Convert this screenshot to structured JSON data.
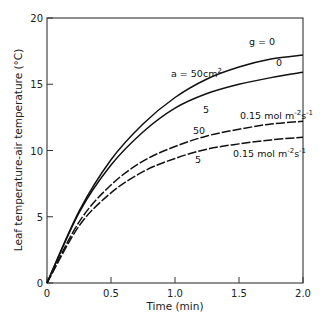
{
  "chart_data": {
    "type": "line",
    "title": "",
    "xlabel": "Time (min)",
    "ylabel": "Leaf temperature-air temperature (°C)",
    "xlim": [
      0,
      2.0
    ],
    "ylim": [
      0,
      20
    ],
    "xticks": [
      "0",
      "0.5",
      "1.0",
      "1.5",
      "2.0"
    ],
    "yticks": [
      "0",
      "5",
      "10",
      "15",
      "20"
    ],
    "grid": false,
    "legend": "none (inline curve annotations)",
    "x": [
      0,
      0.25,
      0.5,
      0.75,
      1.0,
      1.25,
      1.5,
      1.75,
      2.0
    ],
    "series": [
      {
        "name": "a = 50 cm², g = 0",
        "style": "solid",
        "values": [
          0,
          5.4,
          9.3,
          12.0,
          14.0,
          15.4,
          16.3,
          16.9,
          17.2
        ]
      },
      {
        "name": "a = 5 cm², g = 0",
        "style": "solid",
        "values": [
          0,
          5.3,
          8.9,
          11.4,
          13.2,
          14.3,
          15.0,
          15.5,
          15.9
        ]
      },
      {
        "name": "a = 50 cm², g = 0.15 mol m⁻² s⁻¹",
        "style": "dashed",
        "values": [
          0,
          4.6,
          7.4,
          9.2,
          10.3,
          11.1,
          11.6,
          12.0,
          12.2
        ]
      },
      {
        "name": "a = 5 cm², g = 0.15 mol m⁻² s⁻¹",
        "style": "dashed",
        "values": [
          0,
          4.3,
          6.8,
          8.4,
          9.4,
          10.1,
          10.5,
          10.8,
          11.0
        ]
      }
    ],
    "annotations": [
      {
        "text": "g = 0",
        "x": 1.73,
        "y": 18.0
      },
      {
        "text": "0",
        "x": 1.78,
        "y": 16.4
      },
      {
        "text": "a = 50cm²",
        "x": 0.78,
        "y": 15.6
      },
      {
        "text": "5",
        "x": 0.92,
        "y": 12.9
      },
      {
        "text": "0.15 mol m⁻²s⁻¹",
        "x": 1.42,
        "y": 12.6
      },
      {
        "text": "50",
        "x": 0.88,
        "y": 11.0
      },
      {
        "text": "5",
        "x": 0.88,
        "y": 9.1
      },
      {
        "text": "0.15 mol m⁻²s⁻¹",
        "x": 1.33,
        "y": 9.5
      }
    ]
  },
  "labels": {
    "xlabel": "Time (min)",
    "ylabel": "Leaf temperature-air temperature (°C)",
    "ann_g0": "g = 0",
    "ann_0": "0",
    "ann_a50": "a = 50cm",
    "ann_a50_sup": "2",
    "ann_5_solid": "5",
    "ann_mol_upper": "0.15 mol m",
    "ann_mol_lower": "0.15 mol m",
    "ann_50_dashed": "50",
    "ann_5_dashed": "5",
    "sup_m": "-2",
    "s_unit": "s",
    "sup_s": "-1"
  }
}
